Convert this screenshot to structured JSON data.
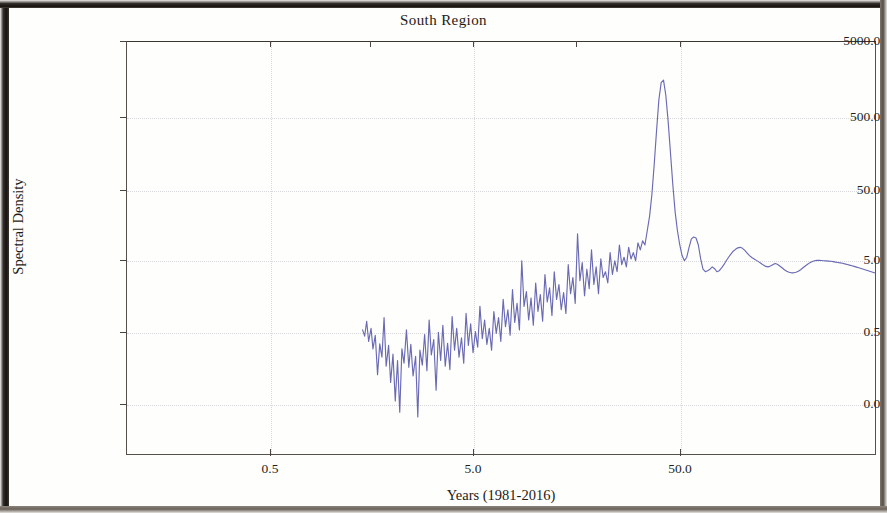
{
  "chart_data": {
    "type": "line",
    "title": "South Region",
    "xlabel": "Years (1981-2016)",
    "ylabel": "Spectral Density",
    "xscale": "log",
    "yscale": "log",
    "grid": true,
    "legend": null,
    "line_color": "#6a6ab4",
    "xlim": [
      0.22,
      260
    ],
    "ylim": [
      0.018,
      9000
    ],
    "xticks": [
      0.5,
      5.0,
      50.0
    ],
    "xtick_labels": [
      "0.5",
      "5.0",
      "50.0"
    ],
    "yticks": [
      0.05,
      0.5,
      5.0,
      50.0,
      500.0,
      5000.0
    ],
    "ytick_labels": [
      "0.05",
      "0.50",
      "5.00",
      "50.00",
      "500.00",
      "5000.00"
    ],
    "series": [
      {
        "name": "Spectral Density",
        "x": [
          2.05,
          2.09,
          2.13,
          2.17,
          2.22,
          2.26,
          2.31,
          2.36,
          2.41,
          2.46,
          2.51,
          2.56,
          2.62,
          2.67,
          2.73,
          2.79,
          2.85,
          2.91,
          2.97,
          3.03,
          3.1,
          3.17,
          3.23,
          3.3,
          3.38,
          3.45,
          3.52,
          3.6,
          3.68,
          3.76,
          3.84,
          3.92,
          4.01,
          4.1,
          4.19,
          4.28,
          4.37,
          4.47,
          4.57,
          4.67,
          4.77,
          4.88,
          4.98,
          5.09,
          5.21,
          5.32,
          5.44,
          5.56,
          5.68,
          5.81,
          5.94,
          6.07,
          6.2,
          6.34,
          6.48,
          6.62,
          6.77,
          6.92,
          7.07,
          7.23,
          7.39,
          7.55,
          7.72,
          7.89,
          8.07,
          8.24,
          8.43,
          8.61,
          8.8,
          9.0,
          9.2,
          9.4,
          9.61,
          9.82,
          10.04,
          10.26,
          10.49,
          10.72,
          10.96,
          11.2,
          11.45,
          11.7,
          11.96,
          12.23,
          12.5,
          12.78,
          13.06,
          13.35,
          13.65,
          13.95,
          14.26,
          14.58,
          14.9,
          15.23,
          15.57,
          15.92,
          16.27,
          16.63,
          17.0,
          17.38,
          17.76,
          18.16,
          18.56,
          18.97,
          19.39,
          19.82,
          20.26,
          20.71,
          21.17,
          21.64,
          22.12,
          22.61,
          23.11,
          23.62,
          24.14,
          24.67,
          25.22,
          25.78,
          26.35,
          26.93,
          27.53,
          28.14,
          28.76,
          29.4,
          30.05,
          30.72,
          31.4,
          32.09,
          32.8,
          33.53,
          34.27,
          35.03,
          35.81,
          36.6,
          37.41,
          38.24,
          39.09,
          39.95,
          40.84,
          41.74,
          42.67,
          43.61,
          44.58,
          45.57,
          46.58,
          47.61,
          48.66,
          49.74,
          50.84,
          51.97,
          53.12,
          54.3,
          55.5,
          56.73,
          57.99,
          59.27,
          60.59,
          61.93,
          63.3,
          64.71,
          66.14,
          67.61,
          69.11,
          70.64,
          72.21,
          73.81,
          75.45,
          77.12,
          78.83,
          80.58,
          82.37,
          84.19,
          86.06,
          87.97,
          89.92,
          91.91,
          93.95,
          96.03,
          98.16,
          100.34,
          102.56,
          104.84,
          107.16,
          109.54,
          111.97,
          114.45,
          116.99,
          119.59,
          122.24,
          124.95,
          127.72,
          130.56,
          133.45,
          136.41,
          139.44,
          142.53,
          145.7,
          148.93,
          152.23,
          155.61,
          159.06,
          162.59,
          166.2,
          169.88,
          173.65,
          177.5,
          181.44,
          185.46,
          189.58,
          193.78,
          198.08,
          202.48,
          206.97,
          211.56,
          216.25,
          221.05,
          225.95,
          230.96,
          236.08,
          241.32,
          246.67,
          252.14,
          257.73
        ],
        "y": [
          0.95,
          0.78,
          1.25,
          0.66,
          1.0,
          0.52,
          0.8,
          0.23,
          0.61,
          0.4,
          1.4,
          0.3,
          0.58,
          0.18,
          0.44,
          0.1,
          0.36,
          0.07,
          0.52,
          0.33,
          0.95,
          0.29,
          0.6,
          0.22,
          0.41,
          0.06,
          0.5,
          0.31,
          0.82,
          0.26,
          1.3,
          0.43,
          0.7,
          0.14,
          0.88,
          0.36,
          1.1,
          0.3,
          0.62,
          0.27,
          1.45,
          0.5,
          1.0,
          0.4,
          0.74,
          0.33,
          1.6,
          0.58,
          1.15,
          0.46,
          0.9,
          0.55,
          2.0,
          0.72,
          1.3,
          0.6,
          1.0,
          0.5,
          1.7,
          0.85,
          1.4,
          0.66,
          2.5,
          1.05,
          1.8,
          0.8,
          3.4,
          1.2,
          2.2,
          0.95,
          8.5,
          2.0,
          3.2,
          1.3,
          2.6,
          1.1,
          4.2,
          1.7,
          2.9,
          1.25,
          5.5,
          2.3,
          3.6,
          1.5,
          6.0,
          2.5,
          4.0,
          1.8,
          3.1,
          1.6,
          7.5,
          3.0,
          5.0,
          2.2,
          20.0,
          4.5,
          8.0,
          2.8,
          6.5,
          3.5,
          12.0,
          4.0,
          7.0,
          3.0,
          9.0,
          5.0,
          6.0,
          4.2,
          11.0,
          5.5,
          8.5,
          6.0,
          14.0,
          7.5,
          9.5,
          7.0,
          13.0,
          9.0,
          11.0,
          8.5,
          15.0,
          12.0,
          16.0,
          14.0,
          22.0,
          35.0,
          70.0,
          180.0,
          520.0,
          1400.0,
          2400.0,
          2600.0,
          1600.0,
          700.0,
          260.0,
          95.0,
          40.0,
          22.0,
          14.0,
          10.0,
          8.5,
          9.5,
          13.0,
          17.0,
          18.0,
          17.5,
          14.0,
          9.0,
          6.5,
          6.0,
          6.2,
          6.5,
          7.0,
          6.6,
          6.0,
          6.2,
          6.8,
          7.5,
          8.5,
          9.5,
          10.5,
          11.5,
          12.2,
          12.8,
          13.0,
          12.6,
          11.8,
          10.8,
          10.0,
          9.4,
          9.0,
          8.6,
          8.2,
          7.8,
          7.4,
          7.1,
          7.0,
          7.2,
          7.5,
          7.8,
          7.6,
          7.2,
          6.8,
          6.4,
          6.1,
          5.9,
          5.8,
          5.8,
          5.9,
          6.1,
          6.4,
          6.8,
          7.2,
          7.6,
          8.0,
          8.3,
          8.5,
          8.6,
          8.6,
          8.55,
          8.5,
          8.45,
          8.4,
          8.35,
          8.25,
          8.15,
          8.05,
          7.95,
          7.85,
          7.7,
          7.55,
          7.4,
          7.25,
          7.1,
          6.95,
          6.8,
          6.65,
          6.5,
          6.35,
          6.2,
          6.05,
          5.9,
          5.75
        ]
      }
    ]
  }
}
